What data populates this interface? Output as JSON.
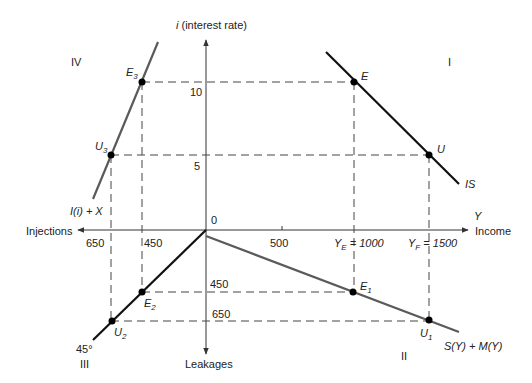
{
  "diagram": {
    "axes": {
      "vertical_label_symbol": "i",
      "vertical_label_text": " (interest rate)",
      "horizontal_right_symbol": "Y",
      "horizontal_right_text": "Income",
      "horizontal_left_text": "Injections",
      "vertical_bottom_text": "Leakages",
      "origin": "0"
    },
    "quadrants": {
      "q1": "I",
      "q2": "II",
      "q3": "III",
      "q4": "IV"
    },
    "ticks": {
      "i_high": "10",
      "i_low": "5",
      "y_500": "500",
      "y_e_sym": "Y",
      "y_e_sub": "E",
      "y_e_val": " = 1000",
      "y_f_sym": "Y",
      "y_f_sub": "F",
      "y_f_val": " = 1500",
      "inj_650": "650",
      "inj_450": "450",
      "leak_450": "450",
      "leak_650": "650"
    },
    "curves": {
      "is": "IS",
      "injections": "I(i) + X",
      "leakages": "S(Y) + M(Y)",
      "angle": "45°"
    },
    "points": {
      "E": "E",
      "U": "U",
      "E1": {
        "sym": "E",
        "sub": "1"
      },
      "U1": {
        "sym": "U",
        "sub": "1"
      },
      "E2": {
        "sym": "E",
        "sub": "2"
      },
      "U2": {
        "sym": "U",
        "sub": "2"
      },
      "E3": {
        "sym": "E",
        "sub": "3"
      },
      "U3": {
        "sym": "U",
        "sub": "3"
      }
    },
    "colors": {
      "axis": "#333333",
      "is_line": "#111111",
      "gray_line": "#5a5a5a",
      "dash": "#444444"
    }
  }
}
